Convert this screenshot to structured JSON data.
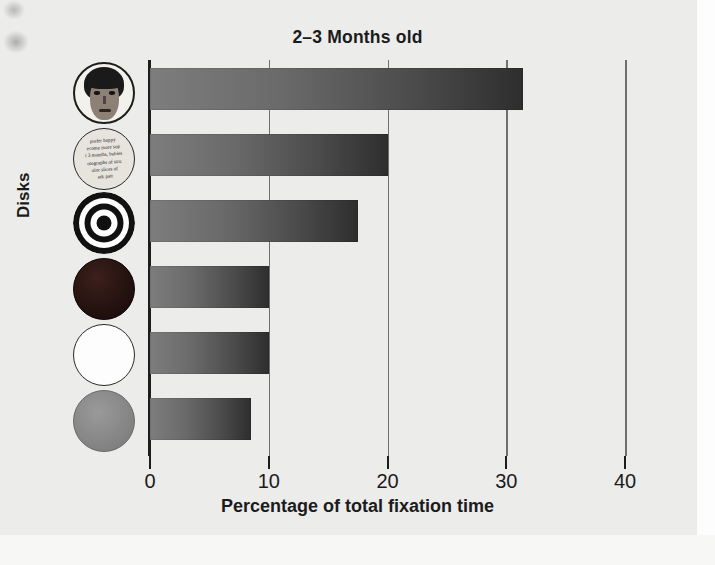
{
  "chart_data": {
    "type": "bar",
    "orientation": "horizontal",
    "title": "2–3 Months old",
    "xlabel": "Percentage of total fixation time",
    "ylabel": "Disks",
    "xlim": [
      0,
      40
    ],
    "xticks": [
      "0",
      "10",
      "20",
      "30",
      "40"
    ],
    "xtick_values": [
      0,
      10,
      20,
      30,
      40
    ],
    "grid": true,
    "legend": "none",
    "categories": [
      "face disk",
      "printed-text disk",
      "bullseye disk",
      "solid red disk",
      "solid white disk",
      "solid gray disk"
    ],
    "values": [
      31.4,
      20.0,
      17.5,
      10.0,
      10.0,
      8.5
    ],
    "bar_color_start": "#7d7d7d",
    "bar_color_end": "#2e2e2e",
    "background_color": "#ececeb"
  },
  "figure": {
    "title": "2–3 Months old",
    "xlabel": "Percentage of total fixation time",
    "ylabel": "Disks"
  },
  "axis": {
    "ticks": [
      {
        "label": "0",
        "value": 0
      },
      {
        "label": "10",
        "value": 10
      },
      {
        "label": "20",
        "value": 20
      },
      {
        "label": "30",
        "value": 30
      },
      {
        "label": "40",
        "value": 40
      }
    ]
  },
  "disks": [
    {
      "icon": "face-disk-icon",
      "label": "face disk",
      "value": 31.4
    },
    {
      "icon": "printed-text-disk-icon",
      "label": "printed-text disk",
      "value": 20.0
    },
    {
      "icon": "bullseye-disk-icon",
      "label": "bullseye disk",
      "value": 17.5
    },
    {
      "icon": "solid-red-disk-icon",
      "label": "solid red disk",
      "value": 10.0
    },
    {
      "icon": "solid-white-disk-icon",
      "label": "solid white disk",
      "value": 10.0
    },
    {
      "icon": "solid-gray-disk-icon",
      "label": "solid gray disk",
      "value": 8.5
    }
  ],
  "text_disk_lines": [
    "prefer happy",
    "ecome more sop",
    "t 3 months, babies",
    "otographs of stru",
    "olor slices of",
    "ark patt"
  ]
}
